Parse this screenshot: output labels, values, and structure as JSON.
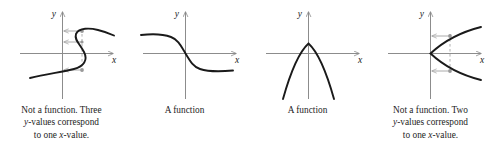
{
  "figure": {
    "background_color": "#ffffff",
    "axis_color": "#8c8c8c",
    "curve_color": "#1a1a1a",
    "annotation_color": "#a0a0a0",
    "width": 491,
    "height": 156
  },
  "panels": [
    {
      "id": "panel-1",
      "axis_label_x": "x",
      "axis_label_y": "y",
      "curve_type": "sideways-s-curve",
      "verdict": "Not a function",
      "caption_lines": [
        {
          "pre": "Not a function. Three",
          "var": "",
          "post": ""
        },
        {
          "pre": "",
          "var": "y",
          "post": "-values correspond"
        },
        {
          "pre": "to one ",
          "var": "x",
          "post": "-value."
        }
      ],
      "caption_text": "Not a function. Three y-values correspond to one x-value.",
      "annotations": {
        "dashed_vertical_line": true,
        "arrow_count": 3,
        "arrow_direction": "left"
      }
    },
    {
      "id": "panel-2",
      "axis_label_x": "x",
      "axis_label_y": "y",
      "curve_type": "decreasing-sigmoid",
      "verdict": "A function",
      "caption_lines": [
        {
          "pre": "A function",
          "var": "",
          "post": ""
        }
      ],
      "caption_text": "A function",
      "annotations": {
        "dashed_vertical_line": false,
        "arrow_count": 0,
        "arrow_direction": ""
      }
    },
    {
      "id": "panel-3",
      "axis_label_x": "x",
      "axis_label_y": "y",
      "curve_type": "downward-parabola",
      "verdict": "A function",
      "caption_lines": [
        {
          "pre": "A function",
          "var": "",
          "post": ""
        }
      ],
      "caption_text": "A function",
      "annotations": {
        "dashed_vertical_line": false,
        "arrow_count": 0,
        "arrow_direction": ""
      }
    },
    {
      "id": "panel-4",
      "axis_label_x": "x",
      "axis_label_y": "y",
      "curve_type": "rightward-parabola",
      "verdict": "Not a function",
      "caption_lines": [
        {
          "pre": "Not a function. Two",
          "var": "",
          "post": ""
        },
        {
          "pre": "",
          "var": "y",
          "post": "-values correspond"
        },
        {
          "pre": "to one ",
          "var": "x",
          "post": "-value."
        }
      ],
      "caption_text": "Not a function. Two y-values correspond to one x-value.",
      "annotations": {
        "dashed_vertical_line": true,
        "arrow_count": 2,
        "arrow_direction": "left"
      }
    }
  ]
}
